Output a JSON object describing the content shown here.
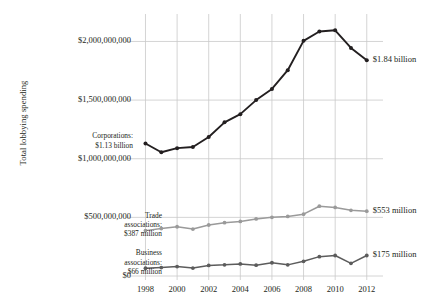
{
  "chart_data": {
    "type": "line",
    "title": "",
    "xlabel": "",
    "ylabel": "Total lobbying spending",
    "x": [
      1998,
      1999,
      2000,
      2001,
      2002,
      2003,
      2004,
      2005,
      2006,
      2007,
      2008,
      2009,
      2010,
      2011,
      2012
    ],
    "xlim": [
      1997.4,
      2012.9
    ],
    "ylim": [
      0,
      2200000000
    ],
    "xticks": [
      "1998",
      "2000",
      "2002",
      "2004",
      "2006",
      "2008",
      "2010",
      "2012"
    ],
    "xtick_values": [
      1998,
      2000,
      2002,
      2004,
      2006,
      2008,
      2010,
      2012
    ],
    "yticks": [
      "$0",
      "$500,000,000",
      "$1,000,000,000",
      "$1,500,000,000",
      "$2,000,000,000"
    ],
    "ytick_values": [
      0,
      500000000,
      1000000000,
      1500000000,
      2000000000
    ],
    "grid": true,
    "legend_position": "inline-annotations",
    "series": [
      {
        "name": "Corporations",
        "color": "#231f20",
        "values": [
          1130000000,
          1055000000,
          1090000000,
          1100000000,
          1185000000,
          1310000000,
          1380000000,
          1500000000,
          1595000000,
          1755000000,
          2005000000,
          2085000000,
          2095000000,
          1945000000,
          1840000000
        ],
        "start_annotation": "Corporations:\n$1.13 billion",
        "end_annotation": "$1.84 billion"
      },
      {
        "name": "Trade associations",
        "color": "#9a9a9a",
        "values": [
          387000000,
          405000000,
          420000000,
          400000000,
          435000000,
          455000000,
          465000000,
          487000000,
          500000000,
          508000000,
          527000000,
          595000000,
          585000000,
          560000000,
          553000000
        ],
        "start_annotation": "Trade\nassociations:\n$387 million",
        "end_annotation": "$553 million"
      },
      {
        "name": "Business associations",
        "color": "#5c5c5c",
        "values": [
          66000000,
          72000000,
          80000000,
          68000000,
          90000000,
          95000000,
          103000000,
          92000000,
          113000000,
          95000000,
          125000000,
          165000000,
          175000000,
          108000000,
          175000000
        ],
        "start_annotation": "Business\nassociations:\n$66 million",
        "end_annotation": "$175 million"
      }
    ]
  },
  "axis": {
    "y_title": "Total lobbying spending",
    "y_ticks": [
      "$2,000,000,000",
      "$1,500,000,000",
      "$1,000,000,000",
      "$500,000,000",
      "$0"
    ],
    "x_ticks": [
      "1998",
      "2000",
      "2002",
      "2004",
      "2006",
      "2008",
      "2010",
      "2012"
    ]
  },
  "annotations": {
    "corporations_start_line1": "Corporations:",
    "corporations_start_line2": "$1.13 billion",
    "corporations_end": "$1.84 billion",
    "trade_start_line1": "Trade",
    "trade_start_line2": "associations:",
    "trade_start_line3": "$387 million",
    "trade_end": "$553 million",
    "business_start_line1": "Business",
    "business_start_line2": "associations:",
    "business_start_line3": "$66 million",
    "business_end": "$175 million"
  },
  "colors": {
    "corporations": "#231f20",
    "trade": "#9a9a9a",
    "business": "#5c5c5c",
    "grid": "#c9c9c9",
    "text": "#231f20",
    "background": "#ffffff"
  }
}
